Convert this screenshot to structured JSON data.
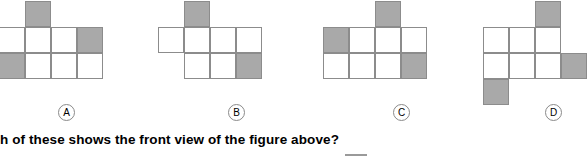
{
  "question": {
    "text": "h of these shows the front view of the figure above?"
  },
  "colors": {
    "shaded_fill": "#a9a9a9",
    "empty_fill": "#ffffff",
    "grid_stroke": "#8c8c8c",
    "text": "#000000",
    "label_stroke": "#8a8a8a",
    "answer_rule": "#9a9a9a"
  },
  "options": [
    {
      "label": "A",
      "label_x": 58,
      "label_y": 104,
      "origin_x": -1,
      "origin_y": 1,
      "cell": 26,
      "cells": [
        {
          "col": 1,
          "row": 0,
          "shaded": true,
          "name": "cell-r0-c1"
        },
        {
          "col": 0,
          "row": 1,
          "shaded": false,
          "name": "cell-r1-c0"
        },
        {
          "col": 1,
          "row": 1,
          "shaded": false,
          "name": "cell-r1-c1"
        },
        {
          "col": 2,
          "row": 1,
          "shaded": false,
          "name": "cell-r1-c2"
        },
        {
          "col": 3,
          "row": 1,
          "shaded": true,
          "name": "cell-r1-c3"
        },
        {
          "col": 0,
          "row": 2,
          "shaded": true,
          "name": "cell-r2-c0"
        },
        {
          "col": 1,
          "row": 2,
          "shaded": false,
          "name": "cell-r2-c1"
        },
        {
          "col": 2,
          "row": 2,
          "shaded": false,
          "name": "cell-r2-c2"
        },
        {
          "col": 3,
          "row": 2,
          "shaded": false,
          "name": "cell-r2-c3"
        }
      ]
    },
    {
      "label": "B",
      "label_x": 228,
      "label_y": 104,
      "origin_x": 158,
      "origin_y": 1,
      "cell": 26,
      "cells": [
        {
          "col": 1,
          "row": 0,
          "shaded": true,
          "name": "cell-r0-c1"
        },
        {
          "col": 0,
          "row": 1,
          "shaded": false,
          "name": "cell-r1-c0"
        },
        {
          "col": 1,
          "row": 1,
          "shaded": false,
          "name": "cell-r1-c1"
        },
        {
          "col": 2,
          "row": 1,
          "shaded": false,
          "name": "cell-r1-c2"
        },
        {
          "col": 3,
          "row": 1,
          "shaded": false,
          "name": "cell-r1-c3"
        },
        {
          "col": 1,
          "row": 2,
          "shaded": false,
          "name": "cell-r2-c1"
        },
        {
          "col": 2,
          "row": 2,
          "shaded": false,
          "name": "cell-r2-c2"
        },
        {
          "col": 3,
          "row": 2,
          "shaded": true,
          "name": "cell-r2-c3"
        }
      ]
    },
    {
      "label": "C",
      "label_x": 393,
      "label_y": 104,
      "origin_x": 323,
      "origin_y": 1,
      "cell": 26,
      "cells": [
        {
          "col": 2,
          "row": 0,
          "shaded": true,
          "name": "cell-r0-c2"
        },
        {
          "col": 0,
          "row": 1,
          "shaded": true,
          "name": "cell-r1-c0"
        },
        {
          "col": 1,
          "row": 1,
          "shaded": false,
          "name": "cell-r1-c1"
        },
        {
          "col": 2,
          "row": 1,
          "shaded": false,
          "name": "cell-r1-c2"
        },
        {
          "col": 3,
          "row": 1,
          "shaded": false,
          "name": "cell-r1-c3"
        },
        {
          "col": 0,
          "row": 2,
          "shaded": false,
          "name": "cell-r2-c0"
        },
        {
          "col": 1,
          "row": 2,
          "shaded": false,
          "name": "cell-r2-c1"
        },
        {
          "col": 2,
          "row": 2,
          "shaded": false,
          "name": "cell-r2-c2"
        },
        {
          "col": 3,
          "row": 2,
          "shaded": true,
          "name": "cell-r2-c3"
        }
      ]
    },
    {
      "label": "D",
      "label_x": 545,
      "label_y": 104,
      "origin_x": 483,
      "origin_y": 1,
      "cell": 26,
      "cells": [
        {
          "col": 2,
          "row": 0,
          "shaded": true,
          "name": "cell-r0-c2"
        },
        {
          "col": 0,
          "row": 1,
          "shaded": false,
          "name": "cell-r1-c0"
        },
        {
          "col": 1,
          "row": 1,
          "shaded": false,
          "name": "cell-r1-c1"
        },
        {
          "col": 2,
          "row": 1,
          "shaded": false,
          "name": "cell-r1-c2"
        },
        {
          "col": 0,
          "row": 2,
          "shaded": false,
          "name": "cell-r2-c0"
        },
        {
          "col": 1,
          "row": 2,
          "shaded": false,
          "name": "cell-r2-c1"
        },
        {
          "col": 2,
          "row": 2,
          "shaded": false,
          "name": "cell-r2-c2"
        },
        {
          "col": 3,
          "row": 2,
          "shaded": true,
          "name": "cell-r2-c3"
        },
        {
          "col": 0,
          "row": 3,
          "shaded": true,
          "name": "cell-r3-c0"
        }
      ]
    }
  ]
}
